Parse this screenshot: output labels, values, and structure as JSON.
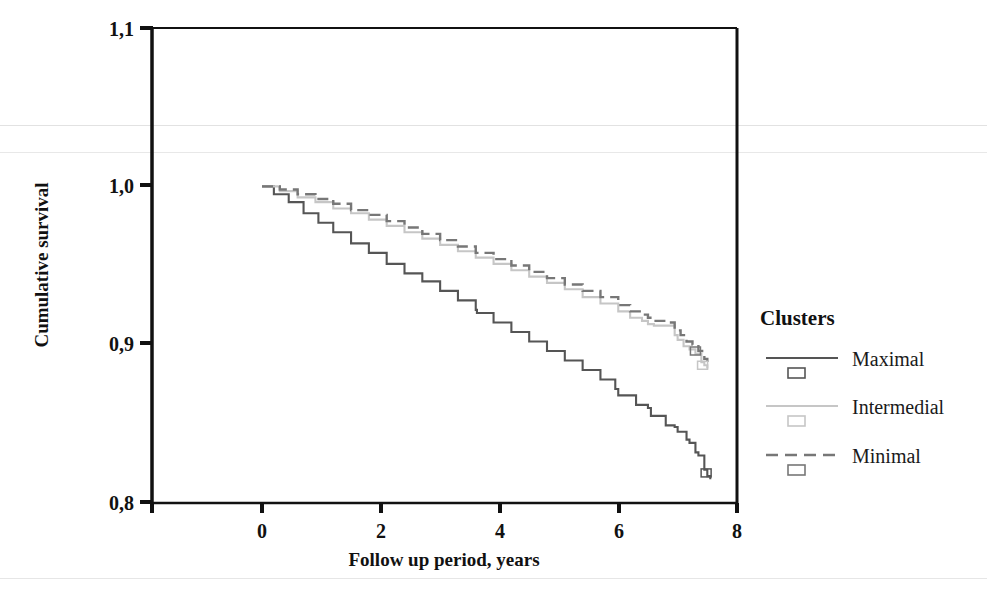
{
  "chart_data": {
    "type": "line",
    "title": "",
    "xlabel": "Follow up period, years",
    "ylabel": "Cumulative survival",
    "xlim": [
      -0.85,
      8.2
    ],
    "ylim": [
      0.8,
      1.1
    ],
    "xticks": [
      "0",
      "2",
      "4",
      "6",
      "8"
    ],
    "xtick_values": [
      0,
      2,
      4,
      6,
      8
    ],
    "yticks": [
      "0,8",
      "0,9",
      "1,0",
      "1,1"
    ],
    "ytick_values": [
      0.8,
      0.9,
      1.0,
      1.1
    ],
    "grid": false,
    "legend_position": "right",
    "legend_title": "Clusters",
    "series": [
      {
        "name": "Maximal",
        "style": "solid",
        "color": "#555555",
        "marker": "censored-rect",
        "x": [
          0.0,
          0.2,
          0.45,
          0.7,
          0.95,
          1.2,
          1.5,
          1.8,
          2.1,
          2.4,
          2.7,
          3.0,
          3.3,
          3.6,
          3.62,
          3.9,
          4.2,
          4.5,
          4.8,
          5.1,
          5.4,
          5.7,
          5.95,
          6.0,
          6.3,
          6.5,
          6.55,
          6.8,
          6.95,
          7.0,
          7.15,
          7.2,
          7.3,
          7.35,
          7.45,
          7.5,
          7.55
        ],
        "y": [
          1.0,
          0.995,
          0.99,
          0.983,
          0.977,
          0.971,
          0.964,
          0.958,
          0.951,
          0.945,
          0.94,
          0.934,
          0.928,
          0.922,
          0.92,
          0.914,
          0.908,
          0.902,
          0.896,
          0.89,
          0.884,
          0.878,
          0.872,
          0.868,
          0.862,
          0.86,
          0.855,
          0.849,
          0.848,
          0.845,
          0.84,
          0.838,
          0.832,
          0.83,
          0.821,
          0.817,
          0.815
        ]
      },
      {
        "name": "Intermedial",
        "style": "solid",
        "color": "#c6c6c6",
        "marker": "censored-rect",
        "x": [
          0.0,
          0.3,
          0.6,
          0.9,
          1.2,
          1.5,
          1.8,
          2.1,
          2.4,
          2.7,
          3.0,
          3.3,
          3.6,
          3.9,
          4.2,
          4.5,
          4.8,
          5.1,
          5.4,
          5.7,
          6.0,
          6.2,
          6.4,
          6.5,
          6.6,
          6.8,
          6.95,
          7.0,
          7.1,
          7.2,
          7.3,
          7.4,
          7.45,
          7.5
        ],
        "y": [
          1.0,
          0.997,
          0.993,
          0.99,
          0.986,
          0.983,
          0.979,
          0.975,
          0.971,
          0.967,
          0.963,
          0.959,
          0.955,
          0.951,
          0.947,
          0.943,
          0.939,
          0.935,
          0.93,
          0.926,
          0.921,
          0.917,
          0.915,
          0.913,
          0.912,
          0.912,
          0.906,
          0.903,
          0.899,
          0.897,
          0.894,
          0.889,
          0.887,
          0.885
        ]
      },
      {
        "name": "Minimal",
        "style": "dashed",
        "color": "#777777",
        "marker": "censored-rect",
        "x": [
          0.0,
          0.3,
          0.6,
          0.9,
          1.2,
          1.5,
          1.8,
          2.1,
          2.4,
          2.7,
          3.0,
          3.3,
          3.6,
          3.9,
          4.2,
          4.5,
          4.8,
          5.1,
          5.4,
          5.7,
          6.0,
          6.2,
          6.4,
          6.5,
          6.6,
          6.8,
          6.95,
          7.05,
          7.15,
          7.25,
          7.35,
          7.45,
          7.5
        ],
        "y": [
          1.0,
          0.998,
          0.995,
          0.992,
          0.989,
          0.985,
          0.982,
          0.978,
          0.974,
          0.97,
          0.966,
          0.962,
          0.958,
          0.954,
          0.95,
          0.946,
          0.942,
          0.938,
          0.934,
          0.93,
          0.925,
          0.921,
          0.919,
          0.917,
          0.915,
          0.914,
          0.909,
          0.906,
          0.902,
          0.9,
          0.896,
          0.891,
          0.889
        ]
      }
    ]
  },
  "axes": {
    "y_title": "Cumulative survival",
    "x_title": "Follow up period, years",
    "ytick_labels": [
      "1,1",
      "1,0",
      "0,9",
      "0,8"
    ],
    "xtick_labels": [
      "0",
      "2",
      "4",
      "6",
      "8"
    ]
  },
  "legend": {
    "title": "Clusters",
    "items": [
      {
        "label": "Maximal",
        "style": "solid",
        "color": "#555555"
      },
      {
        "label": "Intermedial",
        "style": "solid",
        "color": "#c6c6c6"
      },
      {
        "label": "Minimal",
        "style": "dashed",
        "color": "#777777"
      }
    ]
  }
}
